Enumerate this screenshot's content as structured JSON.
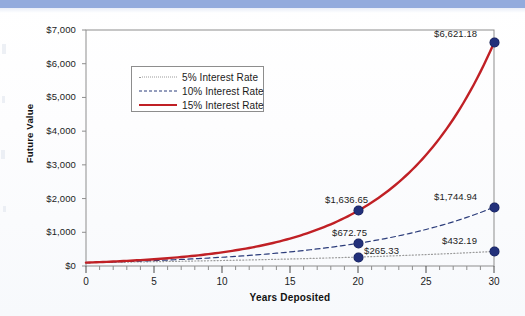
{
  "page": {
    "banner_color": "#93abdd",
    "background_color": "#ffffff"
  },
  "chart_data": {
    "type": "line",
    "title": "",
    "xlabel": "Years Deposited",
    "ylabel": "Future Value",
    "xlim": [
      0,
      30
    ],
    "ylim": [
      0,
      7000
    ],
    "grid": false,
    "legend_position": "upper left inside",
    "x_ticks": [
      0,
      5,
      10,
      15,
      20,
      25,
      30
    ],
    "x_tick_labels": [
      "0",
      "5",
      "10",
      "15",
      "20",
      "25",
      "30"
    ],
    "x_minor_tick_step": 1,
    "y_ticks": [
      0,
      1000,
      2000,
      3000,
      4000,
      5000,
      6000,
      7000
    ],
    "y_tick_labels": [
      "$0",
      "$1,000",
      "$2,000",
      "$3,000",
      "$4,000",
      "$5,000",
      "$6,000",
      "$7,000"
    ],
    "series": [
      {
        "name": "5% Interest Rate",
        "rate": 0.05,
        "style": "dotted",
        "color": "#9a9a9a",
        "x": [
          0,
          5,
          10,
          15,
          20,
          25,
          30
        ],
        "values": [
          100.0,
          127.63,
          162.89,
          207.89,
          265.33,
          338.64,
          432.19
        ]
      },
      {
        "name": "10% Interest Rate",
        "rate": 0.1,
        "style": "dashed",
        "color": "#2b3c7a",
        "x": [
          0,
          5,
          10,
          15,
          20,
          25,
          30
        ],
        "values": [
          100.0,
          161.05,
          259.37,
          417.72,
          672.75,
          1083.47,
          1744.94
        ]
      },
      {
        "name": "15% Interest Rate",
        "rate": 0.15,
        "style": "solid",
        "color": "#c02025",
        "x": [
          0,
          5,
          10,
          15,
          20,
          25,
          30
        ],
        "values": [
          100.0,
          201.14,
          404.56,
          813.71,
          1636.65,
          3291.9,
          6621.18
        ]
      }
    ],
    "annotations": [
      {
        "label": "$6,621.18",
        "x": 30,
        "y": 6621.18,
        "series": "15% Interest Rate"
      },
      {
        "label": "$1,744.94",
        "x": 30,
        "y": 1744.94,
        "series": "10% Interest Rate"
      },
      {
        "label": "$432.19",
        "x": 30,
        "y": 432.19,
        "series": "5% Interest Rate"
      },
      {
        "label": "$1,636.65",
        "x": 20,
        "y": 1636.65,
        "series": "15% Interest Rate"
      },
      {
        "label": "$672.75",
        "x": 20,
        "y": 672.75,
        "series": "10% Interest Rate"
      },
      {
        "label": "$265.33",
        "x": 20,
        "y": 265.33,
        "series": "5% Interest Rate"
      }
    ],
    "marker_color": "#22307a"
  },
  "legend": {
    "items": [
      {
        "label": "5% Interest Rate"
      },
      {
        "label": "10% Interest Rate"
      },
      {
        "label": "15% Interest Rate"
      }
    ]
  },
  "axes": {
    "y_title": "Future Value",
    "x_title": "Years Deposited"
  }
}
